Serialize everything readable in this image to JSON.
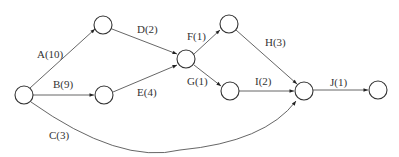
{
  "diagram": {
    "type": "activity-on-arrow network",
    "nodes": [
      {
        "id": "n1",
        "x": 24,
        "y": 95
      },
      {
        "id": "n2",
        "x": 103,
        "y": 25
      },
      {
        "id": "n3",
        "x": 104,
        "y": 95
      },
      {
        "id": "n4",
        "x": 186,
        "y": 59
      },
      {
        "id": "n5",
        "x": 229,
        "y": 24
      },
      {
        "id": "n6",
        "x": 230,
        "y": 91
      },
      {
        "id": "n7",
        "x": 304,
        "y": 91
      },
      {
        "id": "n8",
        "x": 378,
        "y": 91
      }
    ],
    "activities": [
      {
        "id": "A",
        "label": "A(10)",
        "from": "n1",
        "to": "n2",
        "duration": 10
      },
      {
        "id": "B",
        "label": "B(9)",
        "from": "n1",
        "to": "n3",
        "duration": 9
      },
      {
        "id": "C",
        "label": "C(3)",
        "from": "n1",
        "to": "n7",
        "duration": 3
      },
      {
        "id": "D",
        "label": "D(2)",
        "from": "n2",
        "to": "n4",
        "duration": 2
      },
      {
        "id": "E",
        "label": "E(4)",
        "from": "n3",
        "to": "n4",
        "duration": 4
      },
      {
        "id": "F",
        "label": "F(1)",
        "from": "n4",
        "to": "n5",
        "duration": 1
      },
      {
        "id": "G",
        "label": "G(1)",
        "from": "n4",
        "to": "n6",
        "duration": 1
      },
      {
        "id": "H",
        "label": "H(3)",
        "from": "n5",
        "to": "n7",
        "duration": 3
      },
      {
        "id": "I",
        "label": "I(2)",
        "from": "n6",
        "to": "n7",
        "duration": 2
      },
      {
        "id": "J",
        "label": "J(1)",
        "from": "n7",
        "to": "n8",
        "duration": 1
      }
    ]
  }
}
